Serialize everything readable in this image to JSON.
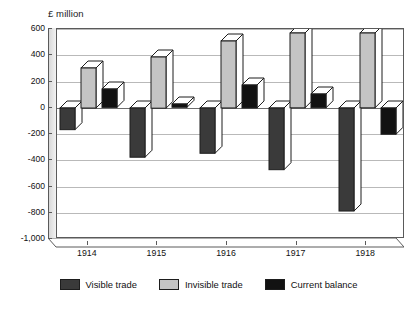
{
  "chart_data": {
    "type": "bar",
    "title": "",
    "subtitle": "",
    "axis_unit_label": "£ million",
    "xlabel": "",
    "ylabel": "",
    "categories": [
      "1914",
      "1915",
      "1916",
      "1917",
      "1918"
    ],
    "ylim": [
      -1000,
      600
    ],
    "yticks": [
      600,
      400,
      200,
      0,
      -200,
      -400,
      -600,
      -800,
      -1000
    ],
    "ytick_labels": [
      "600",
      "400",
      "200",
      "0",
      "-200",
      "-400",
      "-600",
      "-800",
      "-1,000"
    ],
    "grid": true,
    "legend_position": "bottom",
    "series": [
      {
        "name": "Visible trade",
        "color": "#3a3a3a",
        "values": [
          -165,
          -375,
          -345,
          -470,
          -785
        ]
      },
      {
        "name": "Invisible trade",
        "color": "#c4c4c4",
        "values": [
          305,
          390,
          510,
          570,
          570
        ]
      },
      {
        "name": "Current balance",
        "color": "#121212",
        "values": [
          140,
          25,
          175,
          105,
          -200
        ]
      }
    ]
  },
  "legend": {
    "items": [
      {
        "label": "Visible trade",
        "color": "#3a3a3a"
      },
      {
        "label": "Invisible trade",
        "color": "#c4c4c4"
      },
      {
        "label": "Current balance",
        "color": "#121212"
      }
    ]
  },
  "colors": {
    "visible_trade": "#3a3a3a",
    "invisible_trade": "#c4c4c4",
    "current_balance": "#121212",
    "axis": "#5a5a5a",
    "gridline": "#b9b9b9",
    "background": "#ffffff",
    "wall": "#e4e4e4"
  }
}
